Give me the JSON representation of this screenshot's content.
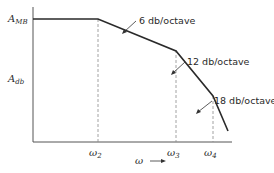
{
  "diagram": {
    "type": "bode-magnitude-asymptote",
    "y_axis": {
      "top_label": "A",
      "top_sub": "MB",
      "mid_label": "A",
      "mid_sub": "db"
    },
    "x_axis": {
      "label": "ω",
      "arrow": "→"
    },
    "ticks": [
      {
        "symbol": "ω",
        "sub": "2"
      },
      {
        "symbol": "ω",
        "sub": "3"
      },
      {
        "symbol": "ω",
        "sub": "4"
      }
    ],
    "slopes": [
      {
        "label": "6 db/octave"
      },
      {
        "label": "12 db/octave"
      },
      {
        "label": "18 db/octave"
      }
    ],
    "colors": {
      "line": "#2a2a2a",
      "dashed": "#8a8a8a",
      "background": "#ffffff"
    }
  }
}
